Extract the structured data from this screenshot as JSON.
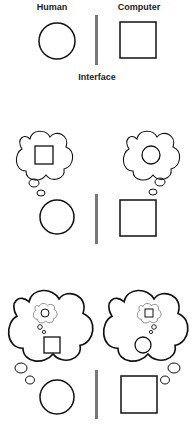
{
  "labels": {
    "human": "Human",
    "computer": "Computer",
    "interface": "Interface"
  },
  "colors": {
    "stroke": "#111111",
    "interface_bar": "#777777",
    "background": "#ffffff"
  },
  "panels": [
    {
      "name": "basic-hci",
      "description": "Human (circle) | Interface | Computer (square)"
    },
    {
      "name": "mutual-models",
      "description": "Human thinks of computer (square); computer models human (circle)"
    },
    {
      "name": "nested-models",
      "description": "Each party models the other's model of itself"
    }
  ]
}
